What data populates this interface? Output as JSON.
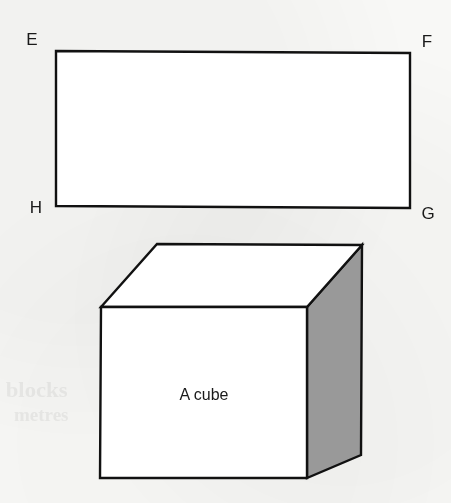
{
  "figure": {
    "background_color": "#f8f8f6",
    "ink_color": "#111111",
    "shade_color": "#999999",
    "rectangle": {
      "name": "rectangle-efgh",
      "labels": {
        "top_left": "E",
        "top_right": "F",
        "bottom_right": "G",
        "bottom_left": "H"
      }
    },
    "cube": {
      "name": "cube-diagram",
      "caption": "A cube",
      "front_face_fill": "#ffffff",
      "top_face_fill": "#ffffff",
      "right_face_fill": "#999999"
    },
    "bleed_through": {
      "line_1": "blocks",
      "line_2": "metres",
      "line_3": "8"
    }
  }
}
